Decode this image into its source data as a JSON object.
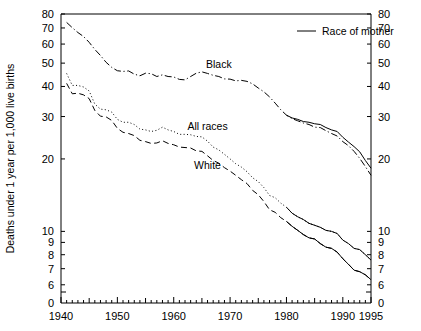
{
  "chart_data": {
    "type": "line",
    "title": "",
    "xlabel": "",
    "ylabel": "Deaths under 1 year per 1,000 live births",
    "xlim": [
      1940,
      1995
    ],
    "ylim": [
      5.6,
      80
    ],
    "yscale": "log",
    "grid": false,
    "axis_break_low_label": "0",
    "legend": {
      "position": "top-right",
      "title": "Race of mother",
      "sample_style": "solid-line"
    },
    "xticks_major": [
      1940,
      1950,
      1960,
      1970,
      1980,
      1990,
      1995
    ],
    "xticklabels": [
      "1940",
      "1950",
      "1960",
      "1970",
      "1980",
      "1990",
      "1995"
    ],
    "xticks_minor_step": 1,
    "yticks": [
      80,
      70,
      60,
      50,
      40,
      30,
      20,
      10,
      9,
      8,
      7,
      6
    ],
    "yticklabels": [
      "80",
      "70",
      "60",
      "50",
      "40",
      "30",
      "20",
      "10",
      "9",
      "8",
      "7",
      "6"
    ],
    "annotations": [
      {
        "text": "Black",
        "x": 1968,
        "y": 47.5
      },
      {
        "text": "All races",
        "x": 1966,
        "y": 26.5
      },
      {
        "text": "White",
        "x": 1966,
        "y": 18.2
      }
    ],
    "series": [
      {
        "name": "Black",
        "label": "Black",
        "linestyle": "dashdot",
        "color": "#000000",
        "x": [
          1941,
          1942,
          1943,
          1944,
          1945,
          1946,
          1947,
          1948,
          1949,
          1950,
          1951,
          1952,
          1953,
          1954,
          1955,
          1956,
          1957,
          1958,
          1959,
          1960,
          1961,
          1962,
          1963,
          1964,
          1965,
          1966,
          1967,
          1968,
          1969,
          1970,
          1971,
          1972,
          1973,
          1974,
          1975,
          1976,
          1977,
          1978,
          1979,
          1980,
          1981,
          1982,
          1983,
          1984,
          1985,
          1986,
          1987,
          1988,
          1989,
          1990,
          1991,
          1992,
          1993,
          1994,
          1995
        ],
        "y": [
          73.8,
          70.2,
          67.0,
          64.5,
          61.0,
          57.0,
          53.8,
          50.4,
          48.0,
          46.5,
          46.2,
          46.4,
          45.0,
          44.3,
          45.4,
          45.2,
          44.0,
          44.7,
          44.0,
          43.8,
          42.8,
          42.6,
          44.0,
          45.4,
          46.0,
          45.3,
          44.5,
          44.0,
          43.0,
          42.9,
          42.2,
          42.4,
          42.0,
          41.0,
          39.4,
          38.0,
          36.2,
          34.1,
          32.0,
          30.4,
          29.4,
          28.8,
          28.2,
          27.8,
          27.1,
          27.0,
          26.2,
          25.5,
          24.9,
          23.6,
          22.7,
          21.5,
          20.1,
          18.6,
          17.1
        ]
      },
      {
        "name": "Black (race of mother)",
        "label": "Black",
        "linestyle": "solid",
        "color": "#000000",
        "x": [
          1980,
          1981,
          1982,
          1983,
          1984,
          1985,
          1986,
          1987,
          1988,
          1989,
          1990,
          1991,
          1992,
          1993,
          1994,
          1995
        ],
        "y": [
          30.4,
          29.6,
          29.2,
          28.6,
          28.4,
          28.0,
          27.8,
          27.0,
          26.4,
          26.0,
          24.6,
          23.5,
          22.5,
          21.4,
          19.7,
          18.3
        ]
      },
      {
        "name": "All races",
        "label": "All races",
        "linestyle": "dotted",
        "color": "#000000",
        "x": [
          1941,
          1942,
          1943,
          1944,
          1945,
          1946,
          1947,
          1948,
          1949,
          1950,
          1951,
          1952,
          1953,
          1954,
          1955,
          1956,
          1957,
          1958,
          1959,
          1960,
          1961,
          1962,
          1963,
          1964,
          1965,
          1966,
          1967,
          1968,
          1969,
          1970,
          1971,
          1972,
          1973,
          1974,
          1975,
          1976,
          1977,
          1978,
          1979,
          1980,
          1981,
          1982,
          1983,
          1984,
          1985,
          1986,
          1987,
          1988,
          1989,
          1990,
          1991,
          1992,
          1993,
          1994,
          1995
        ],
        "y": [
          45.3,
          40.4,
          40.4,
          39.8,
          38.3,
          33.8,
          32.2,
          32.0,
          31.3,
          29.2,
          28.4,
          28.4,
          27.8,
          26.6,
          26.4,
          26.0,
          26.3,
          27.1,
          26.4,
          26.0,
          25.3,
          25.3,
          25.2,
          24.8,
          24.7,
          23.7,
          22.4,
          21.8,
          20.9,
          20.0,
          19.1,
          18.5,
          17.7,
          16.7,
          16.1,
          15.2,
          14.1,
          13.8,
          13.1,
          12.6,
          11.9,
          11.5,
          11.2,
          10.8,
          10.6,
          10.4,
          10.1,
          10.0,
          9.8,
          9.2,
          8.9,
          8.5,
          8.4,
          8.0,
          7.6
        ]
      },
      {
        "name": "All races (race of mother)",
        "label": "All races",
        "linestyle": "solid",
        "color": "#000000",
        "x": [
          1980,
          1981,
          1982,
          1983,
          1984,
          1985,
          1986,
          1987,
          1988,
          1989,
          1990,
          1991,
          1992,
          1993,
          1994,
          1995
        ],
        "y": [
          12.6,
          11.9,
          11.5,
          11.2,
          10.8,
          10.6,
          10.4,
          10.1,
          10.0,
          9.8,
          9.2,
          8.9,
          8.5,
          8.4,
          8.0,
          7.6
        ]
      },
      {
        "name": "White",
        "label": "White",
        "linestyle": "dashed",
        "color": "#000000",
        "x": [
          1941,
          1942,
          1943,
          1944,
          1945,
          1946,
          1947,
          1948,
          1949,
          1950,
          1951,
          1952,
          1953,
          1954,
          1955,
          1956,
          1957,
          1958,
          1959,
          1960,
          1961,
          1962,
          1963,
          1964,
          1965,
          1966,
          1967,
          1968,
          1969,
          1970,
          1971,
          1972,
          1973,
          1974,
          1975,
          1976,
          1977,
          1978,
          1979,
          1980,
          1981,
          1982,
          1983,
          1984,
          1985,
          1986,
          1987,
          1988,
          1989,
          1990,
          1991,
          1992,
          1993,
          1994,
          1995
        ],
        "y": [
          41.2,
          37.3,
          37.5,
          36.9,
          35.6,
          31.8,
          30.1,
          29.9,
          28.9,
          26.8,
          25.8,
          25.5,
          25.0,
          23.9,
          23.6,
          23.2,
          23.3,
          23.8,
          23.2,
          22.9,
          22.4,
          22.3,
          22.2,
          21.6,
          21.5,
          20.6,
          19.7,
          19.2,
          18.4,
          17.8,
          17.1,
          16.4,
          15.8,
          14.8,
          14.2,
          13.3,
          12.3,
          12.0,
          11.4,
          11.0,
          10.5,
          10.1,
          9.7,
          9.4,
          9.3,
          8.9,
          8.6,
          8.5,
          8.2,
          7.7,
          7.3,
          6.9,
          6.8,
          6.6,
          6.3
        ]
      },
      {
        "name": "White (race of mother)",
        "label": "White",
        "linestyle": "solid",
        "color": "#000000",
        "x": [
          1980,
          1981,
          1982,
          1983,
          1984,
          1985,
          1986,
          1987,
          1988,
          1989,
          1990,
          1991,
          1992,
          1993,
          1994,
          1995
        ],
        "y": [
          11.0,
          10.5,
          10.1,
          9.7,
          9.4,
          9.3,
          8.9,
          8.6,
          8.5,
          8.2,
          7.7,
          7.3,
          6.9,
          6.8,
          6.6,
          6.3
        ]
      }
    ]
  }
}
